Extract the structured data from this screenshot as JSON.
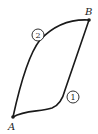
{
  "diagram": {
    "points": [
      {
        "id": "A",
        "label": "A",
        "x": 13,
        "y": 117
      },
      {
        "id": "B",
        "label": "B",
        "x": 89,
        "y": 20
      }
    ],
    "paths": [
      {
        "id": "path-1",
        "label": "1",
        "from": "A",
        "to": "B",
        "description": "lower-right path"
      },
      {
        "id": "path-2",
        "label": "2",
        "from": "A",
        "to": "B",
        "description": "upper-left path"
      }
    ],
    "stroke_color": "#1a1a1a",
    "background": "#ffffff"
  }
}
